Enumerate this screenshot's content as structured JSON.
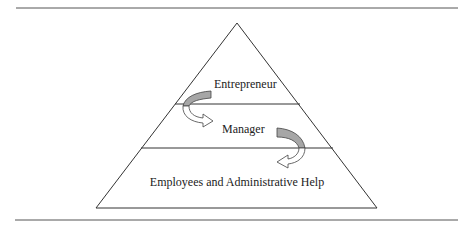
{
  "diagram": {
    "type": "pyramid",
    "levels": [
      {
        "label": "Entrepreneur",
        "position": "top"
      },
      {
        "label": "Manager",
        "position": "middle"
      },
      {
        "label": "Employees and Administrative Help",
        "position": "bottom"
      }
    ],
    "arrows": [
      {
        "from": "Entrepreneur",
        "to": "Manager"
      },
      {
        "from": "Manager",
        "to": "Employees and Administrative Help"
      }
    ],
    "colors": {
      "line": "#333333",
      "arrow_fill": "#a6a6a6",
      "arrow_outline": "#444444",
      "rule": "#555555"
    }
  }
}
